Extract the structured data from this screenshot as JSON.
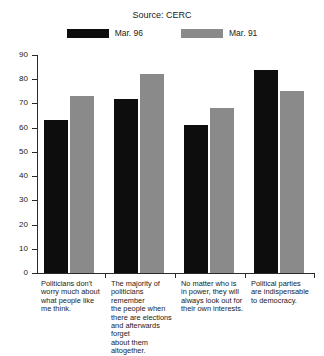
{
  "title": "",
  "source": "Source: CERC",
  "legend": {
    "position": "top-center",
    "items": [
      {
        "label": "Mar. 96",
        "color": "#0d0d0d",
        "swatch_name": "legend-swatch-mar96"
      },
      {
        "label": "Mar. 91",
        "color": "#8a8a8a",
        "swatch_name": "legend-swatch-mar91"
      }
    ]
  },
  "axes": {
    "y_ticks": [
      "0",
      "10",
      "20",
      "30",
      "40",
      "50",
      "60",
      "70",
      "80",
      "90"
    ],
    "y_min": 0,
    "y_max": 90,
    "y_step": 10
  },
  "categories": [
    "Politicians don't worry much about what people like me think.",
    "The majority of politicians remember the people when there are elections and afterwards forget about them altogether.",
    "No matter who is in power, they will always look out for their own interests.",
    "Political parties are indispensable to democracy."
  ],
  "category_lines": [
    [
      "Politicians don't",
      "worry much about",
      "what people like",
      "me think."
    ],
    [
      "The majority of",
      "politicians remember",
      "the people when",
      "there are elections",
      "and afterwards forget",
      "about them altogether."
    ],
    [
      "No matter who is",
      "in power, they will",
      "always look out for",
      "their own interests."
    ],
    [
      "Political parties",
      "are indispensable",
      "to democracy."
    ]
  ],
  "chart_data": {
    "type": "bar",
    "title": "",
    "subtitle": "Source: CERC",
    "xlabel": "",
    "ylabel": "",
    "ylim": [
      0,
      90
    ],
    "ytick_step": 10,
    "grid": false,
    "legend_position": "top-center",
    "categories": [
      "Politicians don't worry much about what people like me think.",
      "The majority of politicians remember the people when there are elections and afterwards forget about them altogether.",
      "No matter who is in power, they will always look out for their own interests.",
      "Political parties are indispensable to democracy."
    ],
    "series": [
      {
        "name": "Mar. 96",
        "color": "#0d0d0d",
        "values": [
          63,
          72,
          61,
          84
        ]
      },
      {
        "name": "Mar. 91",
        "color": "#8a8a8a",
        "values": [
          73,
          82,
          68,
          75
        ]
      }
    ]
  }
}
